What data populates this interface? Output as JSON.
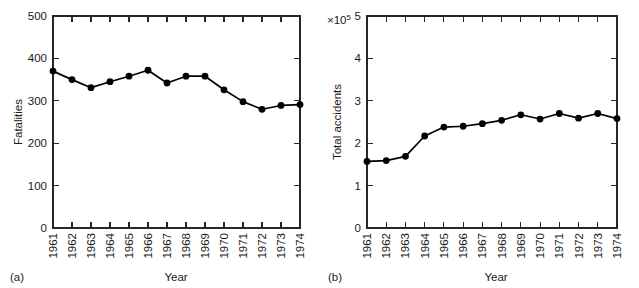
{
  "figure": {
    "background_color": "#ffffff",
    "line_color": "#000000",
    "axis_color": "#262626"
  },
  "panels": [
    {
      "letter": "(a)",
      "xlabel": "Year",
      "ylabel": "Fatalities",
      "exponent_label": ""
    },
    {
      "letter": "(b)",
      "xlabel": "Year",
      "ylabel": "Total accidents",
      "exponent_base": "×10",
      "exponent_power": "5"
    }
  ],
  "chart_data": [
    {
      "type": "line",
      "title": "",
      "panel": "(a)",
      "xlabel": "Year",
      "ylabel": "Fatalities",
      "categories": [
        "1961",
        "1962",
        "1963",
        "1964",
        "1965",
        "1966",
        "1967",
        "1968",
        "1969",
        "1970",
        "1971",
        "1972",
        "1973",
        "1974"
      ],
      "x": [
        1961,
        1962,
        1963,
        1964,
        1965,
        1966,
        1967,
        1968,
        1969,
        1970,
        1971,
        1972,
        1973,
        1974
      ],
      "values": [
        370,
        350,
        331,
        345,
        358,
        372,
        342,
        358,
        358,
        326,
        298,
        280,
        289,
        291
      ],
      "ylim": [
        0,
        500
      ],
      "yticks": [
        0,
        100,
        200,
        300,
        400,
        500
      ],
      "ytick_labels": [
        "0",
        "100",
        "200",
        "300",
        "400",
        "500"
      ],
      "xlim": [
        1961,
        1974
      ],
      "grid": false,
      "legend": false,
      "marker": "filled-circle",
      "series": [
        {
          "name": "Fatalities",
          "values": [
            370,
            350,
            331,
            345,
            358,
            372,
            342,
            358,
            358,
            326,
            298,
            280,
            289,
            291
          ]
        }
      ]
    },
    {
      "type": "line",
      "title": "",
      "panel": "(b)",
      "xlabel": "Year",
      "ylabel": "Total accidents",
      "y_exponent": "×10^5",
      "categories": [
        "1961",
        "1962",
        "1963",
        "1964",
        "1965",
        "1966",
        "1967",
        "1968",
        "1969",
        "1970",
        "1971",
        "1972",
        "1973",
        "1974"
      ],
      "x": [
        1961,
        1962,
        1963,
        1964,
        1965,
        1966,
        1967,
        1968,
        1969,
        1970,
        1971,
        1972,
        1973,
        1974
      ],
      "values": [
        1.57,
        1.59,
        1.69,
        2.17,
        2.38,
        2.4,
        2.46,
        2.54,
        2.67,
        2.57,
        2.7,
        2.59,
        2.7,
        2.58
      ],
      "ylim": [
        0,
        5
      ],
      "yticks": [
        0,
        1,
        2,
        3,
        4,
        5
      ],
      "ytick_labels": [
        "0",
        "1",
        "2",
        "3",
        "4",
        "5"
      ],
      "xlim": [
        1961,
        1974
      ],
      "grid": false,
      "legend": false,
      "marker": "filled-circle",
      "series": [
        {
          "name": "Total accidents",
          "values": [
            1.57,
            1.59,
            1.69,
            2.17,
            2.38,
            2.4,
            2.46,
            2.54,
            2.67,
            2.57,
            2.7,
            2.59,
            2.7,
            2.58
          ]
        }
      ]
    }
  ]
}
